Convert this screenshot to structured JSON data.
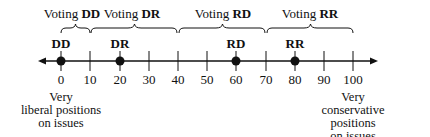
{
  "diagram": {
    "axis": {
      "min": 0,
      "max": 100,
      "step": 10,
      "ticks": [
        "0",
        "10",
        "20",
        "30",
        "40",
        "50",
        "60",
        "70",
        "80",
        "90",
        "100"
      ]
    },
    "points": [
      {
        "label": "DD",
        "value": 0
      },
      {
        "label": "DR",
        "value": 20
      },
      {
        "label": "RD",
        "value": 60
      },
      {
        "label": "RR",
        "value": 80
      }
    ],
    "ranges": [
      {
        "prefix": "Voting ",
        "label": "DD",
        "from": 0,
        "to": 10
      },
      {
        "prefix": "Voting ",
        "label": "DR",
        "from": 10,
        "to": 40
      },
      {
        "prefix": "Voting ",
        "label": "RD",
        "from": 40,
        "to": 70
      },
      {
        "prefix": "Voting ",
        "label": "RR",
        "from": 70,
        "to": 100
      }
    ],
    "left_note": [
      "Very",
      "liberal positions",
      "on issues"
    ],
    "right_note": [
      "Very",
      "conservative positions",
      "on issues"
    ]
  }
}
